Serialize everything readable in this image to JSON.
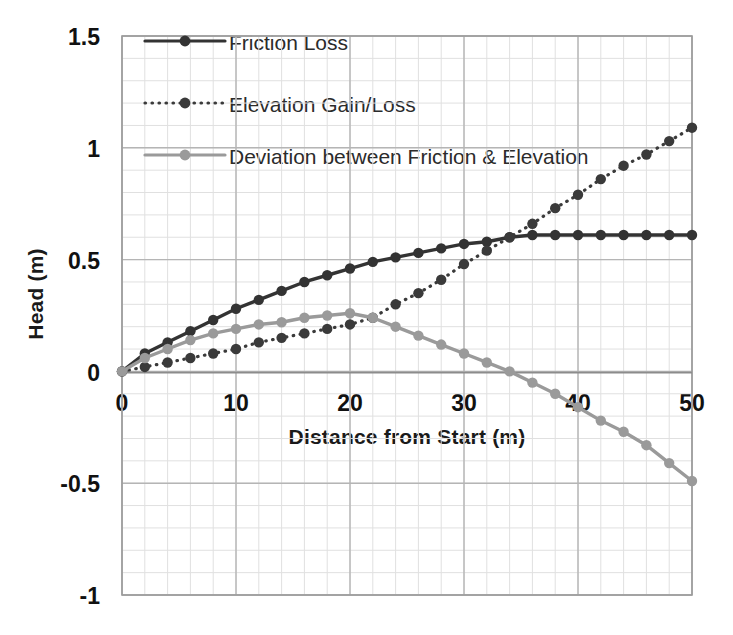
{
  "chart_data": {
    "type": "line",
    "title": "",
    "xlabel": "Distance from Start (m)",
    "ylabel": "Head (m)",
    "xlim": [
      0,
      50
    ],
    "ylim": [
      -1,
      1.5
    ],
    "xticks": [
      "0",
      "10",
      "20",
      "30",
      "40",
      "50"
    ],
    "xtick_values": [
      0,
      10,
      20,
      30,
      40,
      50
    ],
    "yticks": [
      "1.5",
      "1",
      "0.5",
      "0",
      "-0.5",
      "-1"
    ],
    "ytick_values": [
      1.5,
      1,
      0.5,
      0,
      -0.5,
      -1
    ],
    "grid": true,
    "grid_minor": true,
    "legend_position": "upper-left-inside",
    "x": [
      0,
      2,
      4,
      6,
      8,
      10,
      12,
      14,
      16,
      18,
      20,
      22,
      24,
      26,
      28,
      30,
      32,
      34,
      36,
      38,
      40,
      42,
      44,
      46,
      48,
      50
    ],
    "series": [
      {
        "name": "Friction Loss",
        "color": "#333333",
        "style": "solid",
        "marker": "circle",
        "values": [
          0.0,
          0.08,
          0.13,
          0.18,
          0.23,
          0.28,
          0.32,
          0.36,
          0.4,
          0.43,
          0.46,
          0.49,
          0.51,
          0.53,
          0.55,
          0.57,
          0.58,
          0.6,
          0.61,
          0.61,
          0.61,
          0.61,
          0.61,
          0.61,
          0.61,
          0.61
        ]
      },
      {
        "name": "Elevation Gain/Loss",
        "color": "#3a3a3a",
        "style": "dotted",
        "marker": "circle",
        "values": [
          0.0,
          0.02,
          0.04,
          0.06,
          0.08,
          0.1,
          0.13,
          0.15,
          0.17,
          0.19,
          0.21,
          0.24,
          0.3,
          0.35,
          0.41,
          0.48,
          0.54,
          0.6,
          0.66,
          0.73,
          0.79,
          0.86,
          0.92,
          0.97,
          1.03,
          1.09
        ]
      },
      {
        "name": "Deviation between Friction & Elevation",
        "color": "#9a9a9a",
        "style": "solid",
        "marker": "circle",
        "values": [
          0.0,
          0.06,
          0.1,
          0.14,
          0.17,
          0.19,
          0.21,
          0.22,
          0.24,
          0.25,
          0.26,
          0.24,
          0.2,
          0.16,
          0.12,
          0.08,
          0.04,
          0.0,
          -0.05,
          -0.1,
          -0.16,
          -0.22,
          -0.27,
          -0.33,
          -0.41,
          -0.49
        ]
      }
    ],
    "legend": [
      {
        "label": "Friction Loss",
        "color": "#333333",
        "style": "solid"
      },
      {
        "label": "Elevation Gain/Loss",
        "color": "#3a3a3a",
        "style": "dotted"
      },
      {
        "label": "Deviation between Friction & Elevation",
        "color": "#9a9a9a",
        "style": "solid"
      }
    ],
    "colors": {
      "friction": "#333333",
      "elevation": "#3a3a3a",
      "deviation": "#9a9a9a",
      "grid_major": "#b5b5b5",
      "grid_minor": "#e0e0e0",
      "axis": "#8c8c8c",
      "text": "#111111",
      "background": "#ffffff"
    }
  }
}
